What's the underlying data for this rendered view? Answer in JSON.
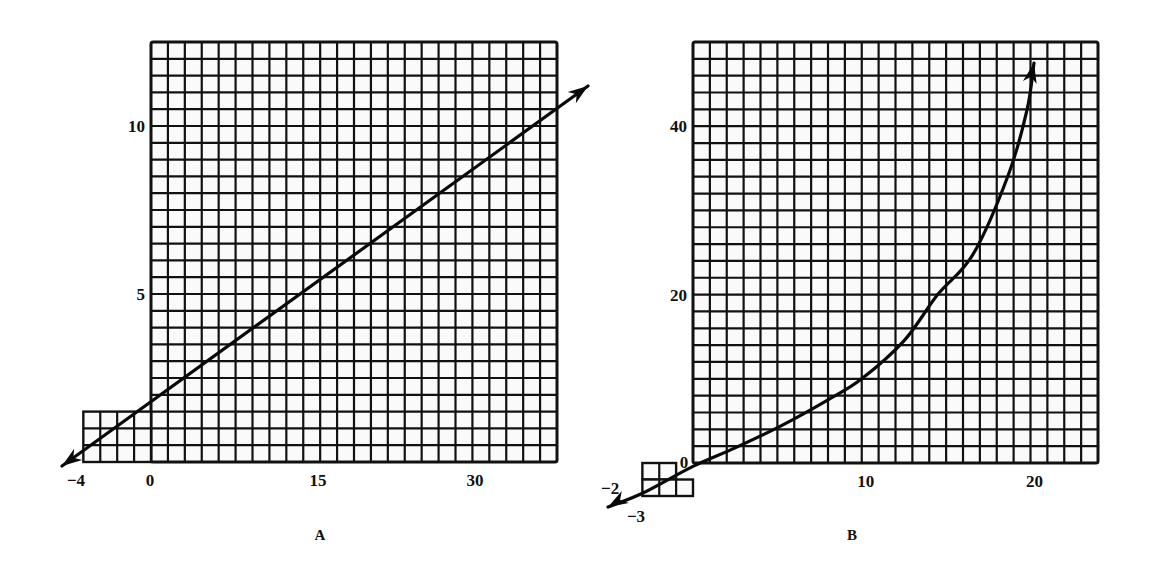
{
  "figure": {
    "panels": [
      {
        "id": "A",
        "label": "A"
      },
      {
        "id": "B",
        "label": "B"
      }
    ]
  },
  "colors": {
    "ink": "#111111",
    "paper": "#ffffff",
    "cell_fill": "#fafafa"
  },
  "chart_data": [
    {
      "panel": "A",
      "type": "line",
      "title": "",
      "xlabel": "",
      "ylabel": "",
      "grid": true,
      "xlim": [
        -4,
        36
      ],
      "ylim": [
        0,
        12.5
      ],
      "x_tick_labels": [
        "-4",
        "0",
        "15",
        "30"
      ],
      "x_tick_values": [
        -4,
        0,
        15,
        30
      ],
      "y_tick_labels": [
        "5",
        "10"
      ],
      "y_tick_values": [
        5,
        10
      ],
      "grid_main": {
        "x_start": 0,
        "x_end": 36,
        "x_step": 1.5,
        "y_start": 0,
        "y_end": 12.5,
        "y_step": 0.5
      },
      "grid_extension": {
        "x_start": -4,
        "x_end": 0,
        "x_step": 1,
        "y_start": 0,
        "y_end": 1.5,
        "y_step": 0.5
      },
      "series": [
        {
          "name": "line",
          "style": "straight line with arrows at both ends",
          "x": [
            -4,
            0,
            8,
            15,
            24,
            32,
            39.5
          ],
          "y": [
            0,
            1,
            3,
            4.75,
            7,
            9,
            10.9
          ]
        }
      ],
      "panel_label": "A",
      "screen": {
        "left": 151,
        "top": 42,
        "right": 557,
        "bottom": 462,
        "cols": 24,
        "rows": 25
      }
    },
    {
      "panel": "B",
      "type": "line",
      "title": "",
      "xlabel": "",
      "ylabel": "",
      "grid": true,
      "xlim": [
        -3,
        24
      ],
      "ylim": [
        -4,
        50
      ],
      "x_tick_labels": [
        "-3",
        "0",
        "10",
        "20"
      ],
      "x_tick_values": [
        -3,
        0,
        10,
        20
      ],
      "y_tick_labels": [
        "-2",
        "20",
        "40"
      ],
      "y_tick_values": [
        -2,
        20,
        40
      ],
      "grid_main": {
        "x_start": 0,
        "x_end": 24,
        "x_step": 1,
        "y_start": 0,
        "y_end": 50,
        "y_step": 2
      },
      "grid_extension": {
        "x_start": -3,
        "x_end": 0,
        "x_step": 1,
        "y_start": -4,
        "y_end": 0,
        "y_step": 2
      },
      "series": [
        {
          "name": "curve",
          "style": "increasing curve with arrows at both ends",
          "x": [
            -5.2,
            -3,
            0,
            2.5,
            5.3,
            8,
            10,
            12.5,
            14.5,
            16.6,
            18.7,
            19.8,
            20.7
          ],
          "y": [
            -5.2,
            -3.6,
            -0.4,
            1.8,
            4.5,
            7.5,
            10,
            14.5,
            20,
            24.8,
            34.3,
            42,
            47.4
          ]
        }
      ],
      "panel_label": "B",
      "screen": {
        "left": 693,
        "top": 42,
        "right": 1098,
        "bottom": 463,
        "cols": 24,
        "rows": 25
      }
    }
  ]
}
